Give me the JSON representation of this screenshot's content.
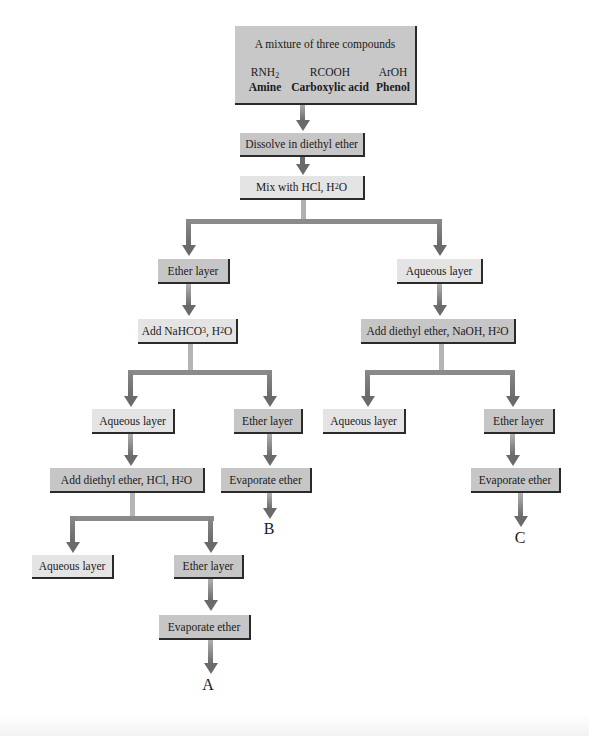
{
  "top_box": {
    "title": "A mixture of three compounds",
    "compounds": [
      {
        "formula": "RNH",
        "sub": "2",
        "name": "Amine"
      },
      {
        "formula": "RCOOH",
        "sub": "",
        "name": "Carboxylic acid"
      },
      {
        "formula": "ArOH",
        "sub": "",
        "name": "Phenol"
      }
    ]
  },
  "steps": {
    "dissolve": "Dissolve in diethyl ether",
    "mix_hcl": {
      "pre": "Mix with HCl, H",
      "sub": "2",
      "post": "O"
    },
    "ether_layer_1": "Ether layer",
    "aqueous_layer_1": "Aqueous layer",
    "add_nahco3": {
      "pre": "Add NaHCO",
      "sub1": "3",
      "mid": ", H",
      "sub2": "2",
      "post": "O"
    },
    "add_ether_naoh": {
      "pre": "Add diethyl ether, NaOH, H",
      "sub": "2",
      "post": "O"
    },
    "aqueous_layer_2": "Aqueous layer",
    "ether_layer_2": "Ether layer",
    "aqueous_layer_3": "Aqueous layer",
    "ether_layer_3": "Ether layer",
    "add_ether_hcl": {
      "pre": "Add diethyl ether, HCl, H",
      "sub": "2",
      "post": "O"
    },
    "evaporate_b": "Evaporate ether",
    "evaporate_c": "Evaporate ether",
    "aqueous_layer_4": "Aqueous layer",
    "ether_layer_4": "Ether layer",
    "evaporate_a": "Evaporate ether"
  },
  "products": {
    "a": "A",
    "b": "B",
    "c": "C"
  },
  "colors": {
    "light_box": "#e4e4e4",
    "dark_box": "#c6c6c6",
    "arrow": "#6a6a6a",
    "connector": "#8a8a8a"
  }
}
